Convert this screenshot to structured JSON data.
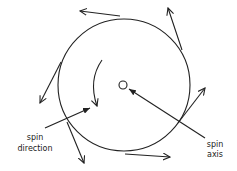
{
  "diagram": {
    "labels": {
      "spin_direction_line1": "spin",
      "spin_direction_line2": "direction",
      "spin_axis_line1": "spin",
      "spin_axis_line2": "axis"
    },
    "colors": {
      "ink": "#222222",
      "background": "#ffffff"
    }
  }
}
